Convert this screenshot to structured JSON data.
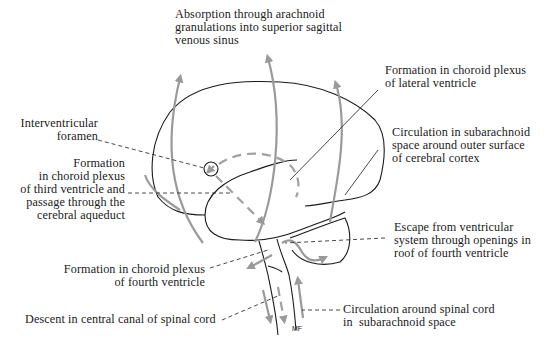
{
  "diagram": {
    "labels": {
      "absorption": "Absorption through arachnoid\ngranulations into superior sagittal\nvenous sinus",
      "lateral_ventricle": "Formation in choroid plexus\nof lateral ventricle",
      "subarachnoid_cortex": "Circulation in subarachnoid\nspace around outer surface\nof cerebral cortex",
      "interventricular_foramen": "Interventricular\nforamen",
      "third_ventricle": "Formation\nin choroid plexus\nof third ventricle and\npassage through the\ncerebral aqueduct",
      "escape": "Escape from ventricular\nsystem through openings in\nroof of fourth ventricle",
      "fourth_ventricle": "Formation in choroid plexus\nof fourth ventricle",
      "spinal_circulation": "Circulation around spinal cord\nin  subarachnoid space",
      "central_canal": "Descent in central canal of spinal cord"
    },
    "signature": "MF",
    "colors": {
      "outline": "#1a1a1a",
      "flow": "#9a9a9a",
      "background": "#ffffff"
    }
  }
}
